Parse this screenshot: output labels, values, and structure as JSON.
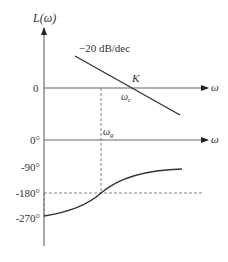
{
  "diagram": {
    "magnitude_panel": {
      "y_axis_label": "L(ω)",
      "zero_label": "0",
      "x_axis_label": "ω",
      "slope_label": "−20 dB/dec",
      "point_label": "K",
      "crossover_label": "ω",
      "crossover_subscript": "c"
    },
    "phase_panel": {
      "x_axis_label": "ω",
      "crossover_label": "ω",
      "crossover_subscript": "g",
      "tick_labels": [
        "0°",
        "-90°",
        "-180°",
        "-270°"
      ]
    },
    "colors": {
      "line": "#333333",
      "axis": "#555555",
      "dashed": "#777777"
    }
  }
}
